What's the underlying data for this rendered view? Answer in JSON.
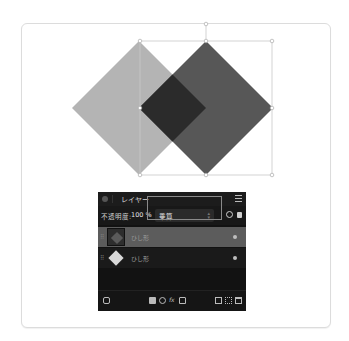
{
  "canvas": {
    "shapes": [
      {
        "name": "light-diamond",
        "fill": "#b4b4b4",
        "center": [
          139,
          108
        ],
        "half": 67
      },
      {
        "name": "dark-diamond",
        "fill": "#575757",
        "center": [
          206,
          108
        ],
        "half": 67
      },
      {
        "name": "overlap",
        "fill": "#2b2b2b"
      }
    ],
    "selection_box": {
      "x": 140,
      "y": 41,
      "w": 132,
      "h": 134
    },
    "colors": {
      "frame_border": "#dcdcdc",
      "selection": "#c8c8c8"
    }
  },
  "layers_panel": {
    "title": "レイヤー",
    "opacity_label": "不透明度:",
    "opacity_value": "100 %",
    "blend_mode": "乗算",
    "layers": [
      {
        "name": "（シェイプ）",
        "label": "ひし形",
        "selected": true,
        "thumb_color": "#5a5a5a",
        "visible": true
      },
      {
        "name": "（シェイプ）",
        "label": "ひし形",
        "selected": false,
        "thumb_color": "#d9d9d9",
        "visible": true
      }
    ],
    "bottom_icons": [
      "layer-options-icon",
      "mask-icon",
      "adjustment-icon",
      "fx-icon",
      "live-filter-icon",
      "add-pixel-layer-icon",
      "group-icon",
      "trash-icon"
    ]
  }
}
